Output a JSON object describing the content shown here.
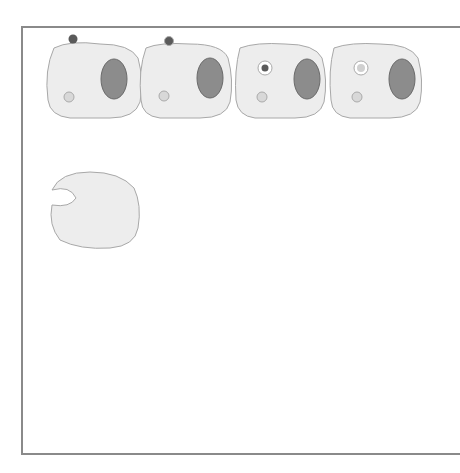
{
  "colors": {
    "cell_fill": "#ededed",
    "cell_stroke": "#a8a8a8",
    "nucleus": "#8c8c8c",
    "eb_dark": "#5a5a5a",
    "rb_light": "#c9c9c9",
    "lysosome": "#d8d8d8",
    "frame": "#8a8a8a"
  },
  "steps": [
    {
      "num": "1.",
      "lines": [
        "Elementary",
        "body (EB)",
        "attaches to",
        "surface of cell"
      ]
    },
    {
      "num": "2.",
      "lines": [
        "Endocytosis of",
        "EB occurs"
      ]
    },
    {
      "num": "3.",
      "lines": [
        "EB is in",
        "endosome, which",
        "does",
        "not",
        "fuse",
        "with lysosome"
      ]
    },
    {
      "num": "4.",
      "lines": [
        "EB reorganizes",
        "into reticulate",
        "body (RB) in",
        "endosome"
      ]
    },
    {
      "num": "5.",
      "lines": [
        "RB replicates",
        "by binary fission"
      ]
    },
    {
      "num": "6.",
      "lines": [
        "RBs are",
        "reorganized to",
        "EBs"
      ]
    },
    {
      "num": "7.",
      "lines": [
        "Inclusion",
        "granule has both",
        "RBs and EBs"
      ]
    },
    {
      "num": "8.",
      "lines": [
        "C. pneumoniae",
        "and",
        "C. trachomatis:",
        "reverse",
        "endocytosis"
      ]
    },
    {
      "num": "8.",
      "lines": [
        "C. psittaci:",
        "Lysis of cells and inclusions"
      ]
    }
  ]
}
